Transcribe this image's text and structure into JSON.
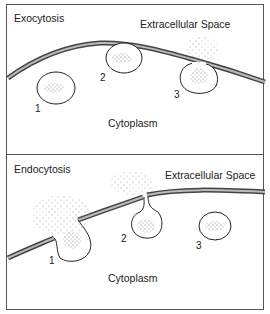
{
  "exocytosis": {
    "title": "Exocytosis",
    "extracellular": "Extracellular Space",
    "cytoplasm": "Cytoplasm",
    "steps": [
      "1",
      "2",
      "3"
    ]
  },
  "endocytosis": {
    "title": "Endocytosis",
    "extracellular": "Extracellular Space",
    "cytoplasm": "Cytoplasm",
    "steps": [
      "1",
      "2",
      "3"
    ]
  }
}
